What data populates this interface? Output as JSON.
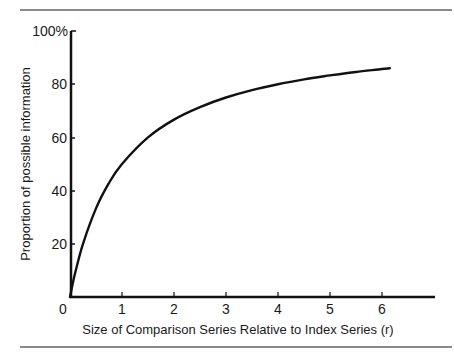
{
  "chart_data": {
    "type": "line",
    "title": "",
    "xlabel": "Size of Comparison Series Relative to Index Series (r)",
    "ylabel": "Proportion of possible information",
    "x_ticks": [
      "0",
      "1",
      "2",
      "3",
      "4",
      "5",
      "6"
    ],
    "y_ticks": [
      "0",
      "20",
      "40",
      "60",
      "80",
      "100%"
    ],
    "xlim": [
      0,
      7
    ],
    "ylim": [
      0,
      100
    ],
    "grid": false,
    "legend": null,
    "series": [
      {
        "name": "Proportion of possible information",
        "x": [
          0,
          0.05,
          0.1,
          0.25,
          0.5,
          0.75,
          1,
          1.5,
          2,
          2.5,
          3,
          3.5,
          4,
          4.5,
          5,
          5.5,
          6,
          6.15
        ],
        "values": [
          0,
          4.8,
          9.1,
          20,
          33.3,
          42.9,
          50,
          60,
          66.7,
          71.4,
          75,
          77.8,
          80,
          81.8,
          83.3,
          84.6,
          85.7,
          86.0
        ]
      }
    ]
  }
}
